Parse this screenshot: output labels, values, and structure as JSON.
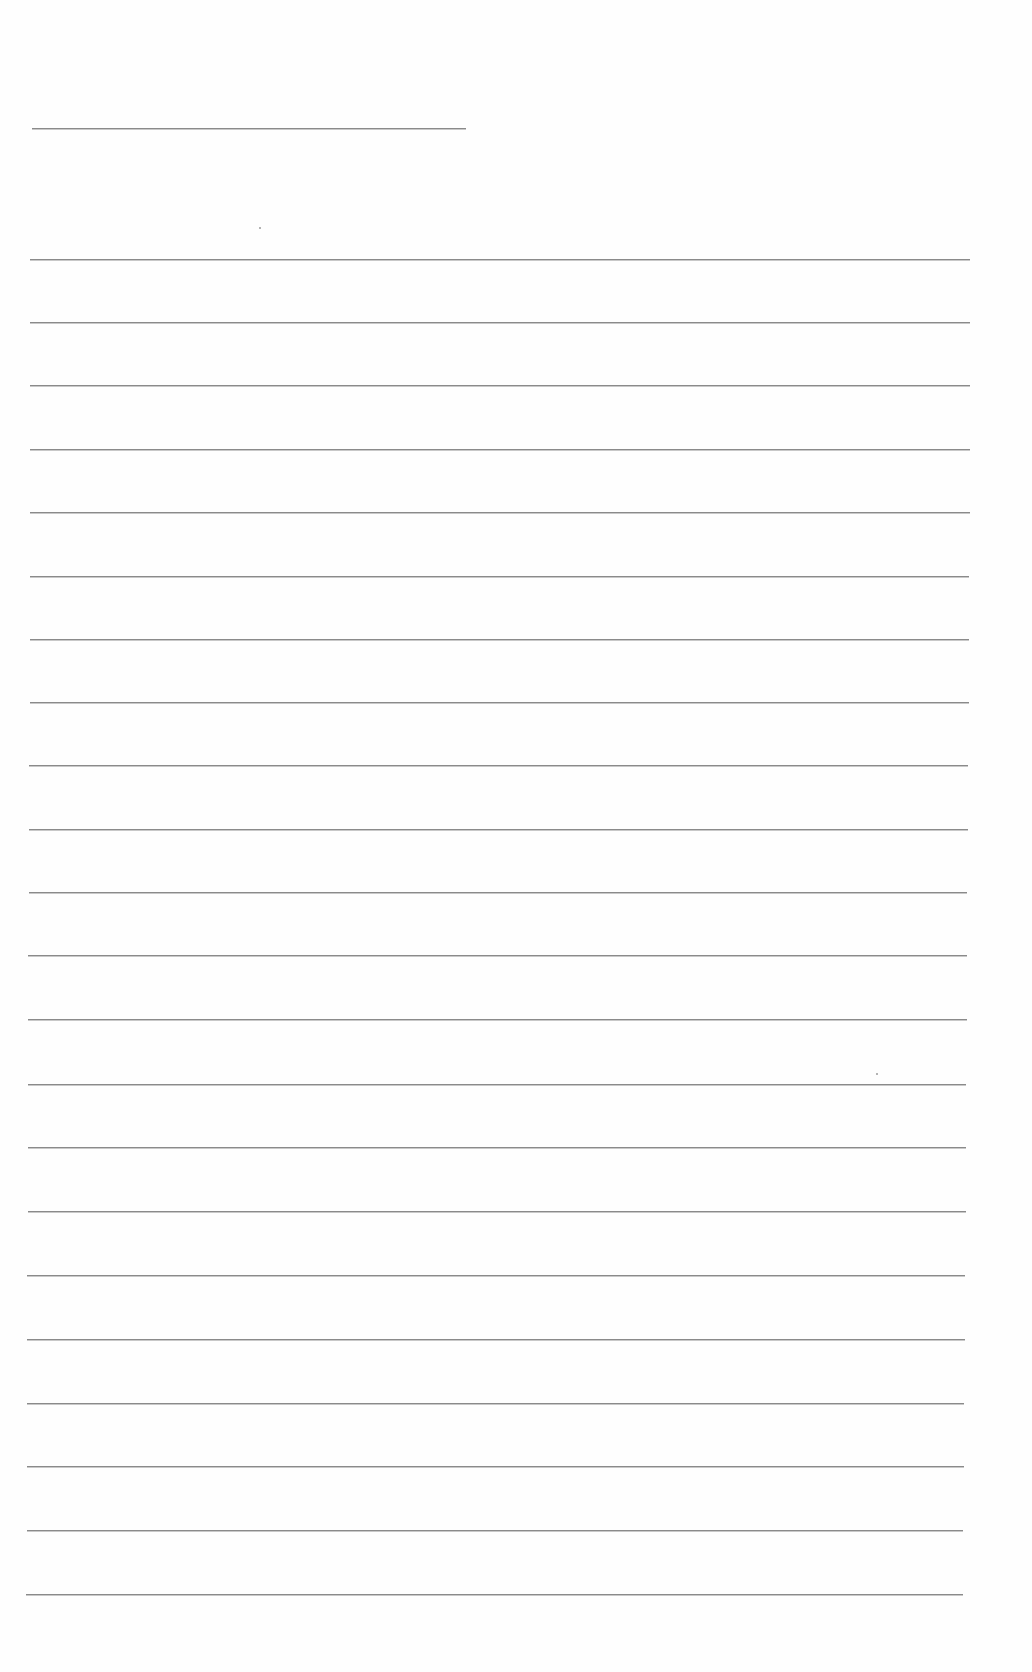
{
  "page": {
    "type": "lined-paper",
    "background": "#fefefe",
    "line_color": "#8a8a8a",
    "header_line": {
      "left": 32,
      "top": 128,
      "width": 434
    },
    "ruled_lines": [
      {
        "top": 259,
        "left": 30,
        "right": 970
      },
      {
        "top": 322,
        "left": 30,
        "right": 970
      },
      {
        "top": 385,
        "left": 30,
        "right": 970
      },
      {
        "top": 449,
        "left": 30,
        "right": 970
      },
      {
        "top": 512,
        "left": 30,
        "right": 970
      },
      {
        "top": 576,
        "left": 30,
        "right": 969
      },
      {
        "top": 639,
        "left": 30,
        "right": 969
      },
      {
        "top": 702,
        "left": 30,
        "right": 969
      },
      {
        "top": 765,
        "left": 29,
        "right": 968
      },
      {
        "top": 829,
        "left": 29,
        "right": 968
      },
      {
        "top": 892,
        "left": 29,
        "right": 967
      },
      {
        "top": 955,
        "left": 28,
        "right": 967
      },
      {
        "top": 1019,
        "left": 28,
        "right": 967
      },
      {
        "top": 1084,
        "left": 28,
        "right": 966
      },
      {
        "top": 1147,
        "left": 28,
        "right": 966
      },
      {
        "top": 1211,
        "left": 28,
        "right": 966
      },
      {
        "top": 1275,
        "left": 27,
        "right": 965
      },
      {
        "top": 1339,
        "left": 27,
        "right": 965
      },
      {
        "top": 1403,
        "left": 27,
        "right": 964
      },
      {
        "top": 1466,
        "left": 27,
        "right": 964
      },
      {
        "top": 1530,
        "left": 27,
        "right": 963
      },
      {
        "top": 1594,
        "left": 26,
        "right": 963
      }
    ],
    "text_content": []
  }
}
